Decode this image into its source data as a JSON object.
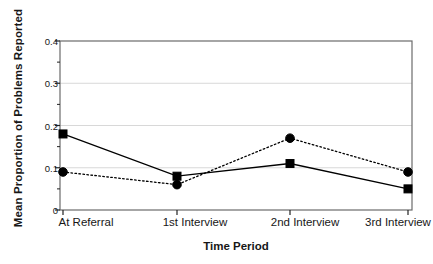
{
  "chart_data": {
    "type": "line",
    "title": "",
    "xlabel": "Time Period",
    "ylabel": "Mean Proportion of Problems Reported",
    "categories": [
      "At Referral",
      "1st Interview",
      "2nd Interview",
      "3rd Interview"
    ],
    "ylim": [
      0,
      0.4
    ],
    "yticks": [
      0,
      0.1,
      0.2,
      0.3,
      0.4
    ],
    "ytick_labels": [
      "0",
      "0.1",
      "0.2",
      "0.3",
      "0.4"
    ],
    "grid": true,
    "grid_color": "#d8d8d8",
    "legend": "none",
    "series": [
      {
        "name": "solid-square-series",
        "line_style": "solid",
        "marker": "square",
        "color": "#000000",
        "values": [
          0.18,
          0.08,
          0.11,
          0.05
        ]
      },
      {
        "name": "dotted-circle-series",
        "line_style": "dotted",
        "marker": "circle",
        "color": "#000000",
        "values": [
          0.09,
          0.06,
          0.17,
          0.09
        ]
      }
    ]
  },
  "axes": {
    "frame_color": "#6b6b6b",
    "background": "#ffffff"
  }
}
